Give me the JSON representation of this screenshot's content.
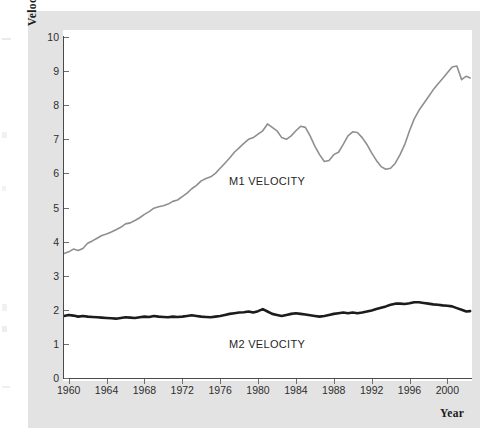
{
  "chart_data": {
    "type": "line",
    "title": "",
    "xlabel": "Year",
    "ylabel": "Velocity",
    "xlim": [
      1959.4,
      2002.6
    ],
    "ylim": [
      0,
      10
    ],
    "grid": false,
    "legend_position": "inline-annotation",
    "y_ticks": [
      0,
      1,
      2,
      3,
      4,
      5,
      6,
      7,
      8,
      9,
      10
    ],
    "x_ticks": [
      1960,
      1964,
      1968,
      1972,
      1976,
      1980,
      1984,
      1988,
      1992,
      1996,
      2000
    ],
    "series": [
      {
        "name": "M1 VELOCITY",
        "color": "#8f8f8f",
        "annotation": "M1 VELOCITY",
        "x": [
          1959.5,
          1960,
          1960.5,
          1961,
          1961.5,
          1962,
          1962.5,
          1963,
          1963.5,
          1964,
          1964.5,
          1965,
          1965.5,
          1966,
          1966.5,
          1967,
          1967.5,
          1968,
          1968.5,
          1969,
          1969.5,
          1970,
          1970.5,
          1971,
          1971.5,
          1972,
          1972.5,
          1973,
          1973.5,
          1974,
          1974.5,
          1975,
          1975.5,
          1976,
          1976.5,
          1977,
          1977.5,
          1978,
          1978.5,
          1979,
          1979.5,
          1980,
          1980.5,
          1981,
          1981.5,
          1982,
          1982.5,
          1983,
          1983.5,
          1984,
          1984.5,
          1985,
          1985.5,
          1986,
          1986.5,
          1987,
          1987.5,
          1988,
          1988.5,
          1989,
          1989.5,
          1990,
          1990.5,
          1991,
          1991.5,
          1992,
          1992.5,
          1993,
          1993.5,
          1994,
          1994.5,
          1995,
          1995.5,
          1996,
          1996.5,
          1997,
          1997.5,
          1998,
          1998.5,
          1999,
          1999.5,
          2000,
          2000.5,
          2001,
          2001.5,
          2002,
          2002.4
        ],
        "y": [
          3.65,
          3.7,
          3.78,
          3.74,
          3.8,
          3.95,
          4.02,
          4.1,
          4.18,
          4.22,
          4.28,
          4.35,
          4.42,
          4.52,
          4.55,
          4.62,
          4.7,
          4.8,
          4.88,
          4.98,
          5.02,
          5.05,
          5.1,
          5.18,
          5.22,
          5.32,
          5.42,
          5.55,
          5.65,
          5.78,
          5.85,
          5.9,
          6.0,
          6.15,
          6.3,
          6.45,
          6.62,
          6.75,
          6.88,
          7.0,
          7.05,
          7.15,
          7.25,
          7.45,
          7.35,
          7.25,
          7.05,
          7.0,
          7.1,
          7.25,
          7.38,
          7.35,
          7.1,
          6.8,
          6.55,
          6.35,
          6.38,
          6.55,
          6.62,
          6.85,
          7.1,
          7.22,
          7.2,
          7.05,
          6.85,
          6.6,
          6.38,
          6.2,
          6.12,
          6.15,
          6.3,
          6.55,
          6.85,
          7.25,
          7.6,
          7.85,
          8.05,
          8.25,
          8.45,
          8.62,
          8.78,
          8.95,
          9.12,
          9.15,
          8.75,
          8.85,
          8.8
        ],
        "linewidth": 1.6
      },
      {
        "name": "M2 VELOCITY",
        "color": "#1c1c1c",
        "annotation": "M2 VELOCITY",
        "x": [
          1959.5,
          1960,
          1960.5,
          1961,
          1961.5,
          1962,
          1962.5,
          1963,
          1963.5,
          1964,
          1964.5,
          1965,
          1965.5,
          1966,
          1966.5,
          1967,
          1967.5,
          1968,
          1968.5,
          1969,
          1969.5,
          1970,
          1970.5,
          1971,
          1971.5,
          1972,
          1972.5,
          1973,
          1973.5,
          1974,
          1974.5,
          1975,
          1975.5,
          1976,
          1976.5,
          1977,
          1977.5,
          1978,
          1978.5,
          1979,
          1979.5,
          1980,
          1980.5,
          1981,
          1981.5,
          1982,
          1982.5,
          1983,
          1983.5,
          1984,
          1984.5,
          1985,
          1985.5,
          1986,
          1986.5,
          1987,
          1987.5,
          1988,
          1988.5,
          1989,
          1989.5,
          1990,
          1990.5,
          1991,
          1991.5,
          1992,
          1992.5,
          1993,
          1993.5,
          1994,
          1994.5,
          1995,
          1995.5,
          1996,
          1996.5,
          1997,
          1997.5,
          1998,
          1998.5,
          1999,
          1999.5,
          2000,
          2000.5,
          2001,
          2001.5,
          2002,
          2002.4
        ],
        "y": [
          1.82,
          1.85,
          1.83,
          1.8,
          1.82,
          1.8,
          1.79,
          1.78,
          1.77,
          1.76,
          1.75,
          1.74,
          1.76,
          1.78,
          1.77,
          1.76,
          1.78,
          1.8,
          1.79,
          1.82,
          1.8,
          1.79,
          1.78,
          1.8,
          1.79,
          1.8,
          1.82,
          1.84,
          1.82,
          1.8,
          1.79,
          1.78,
          1.8,
          1.82,
          1.85,
          1.88,
          1.9,
          1.92,
          1.93,
          1.95,
          1.92,
          1.96,
          2.02,
          1.95,
          1.88,
          1.85,
          1.82,
          1.85,
          1.88,
          1.9,
          1.88,
          1.86,
          1.84,
          1.82,
          1.8,
          1.82,
          1.85,
          1.88,
          1.9,
          1.92,
          1.9,
          1.92,
          1.9,
          1.92,
          1.95,
          1.98,
          2.02,
          2.06,
          2.1,
          2.15,
          2.18,
          2.18,
          2.17,
          2.19,
          2.22,
          2.22,
          2.2,
          2.18,
          2.16,
          2.15,
          2.13,
          2.12,
          2.1,
          2.05,
          2.0,
          1.95,
          1.96
        ],
        "linewidth": 2.6
      }
    ]
  },
  "axes": {
    "y_title": "Velocity",
    "x_title": "Year",
    "y_tick_labels": [
      "0",
      "1",
      "2",
      "3",
      "4",
      "5",
      "6",
      "7",
      "8",
      "9",
      "10"
    ],
    "x_tick_labels": [
      "1960",
      "1964",
      "1968",
      "1972",
      "1976",
      "1980",
      "1984",
      "1988",
      "1992",
      "1996",
      "2000"
    ]
  },
  "annotations": {
    "m1_label": "M1 VELOCITY",
    "m2_label": "M2 VELOCITY"
  },
  "colors": {
    "m1_line": "#8f8f8f",
    "m2_line": "#1c1c1c",
    "panel_background": "#e3e3e3",
    "plot_background": "#ffffff",
    "axis": "#4a4a4a",
    "text": "#2e2e2e"
  }
}
